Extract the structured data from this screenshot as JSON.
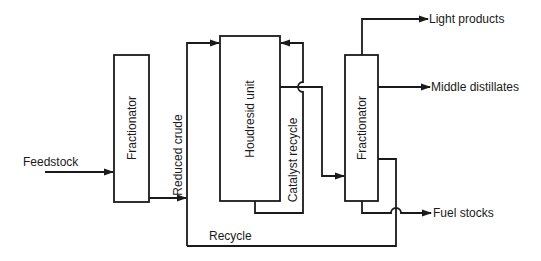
{
  "diagram": {
    "type": "process-flow",
    "units": [
      {
        "id": "fractionator-1",
        "label": "Fractionator"
      },
      {
        "id": "houdresid-unit",
        "label": "Houdresid unit"
      },
      {
        "id": "fractionator-2",
        "label": "Fractionator"
      }
    ],
    "streams": {
      "feedstock": "Feedstock",
      "reduced_crude": "Reduced crude",
      "catalyst_recycle": "Catalyst recycle",
      "recycle": "Recycle",
      "light_products": "Light products",
      "middle_distillates": "Middle distillates",
      "fuel_stocks": "Fuel stocks"
    },
    "colors": {
      "stroke": "#1a1a1a",
      "background": "#ffffff"
    }
  }
}
